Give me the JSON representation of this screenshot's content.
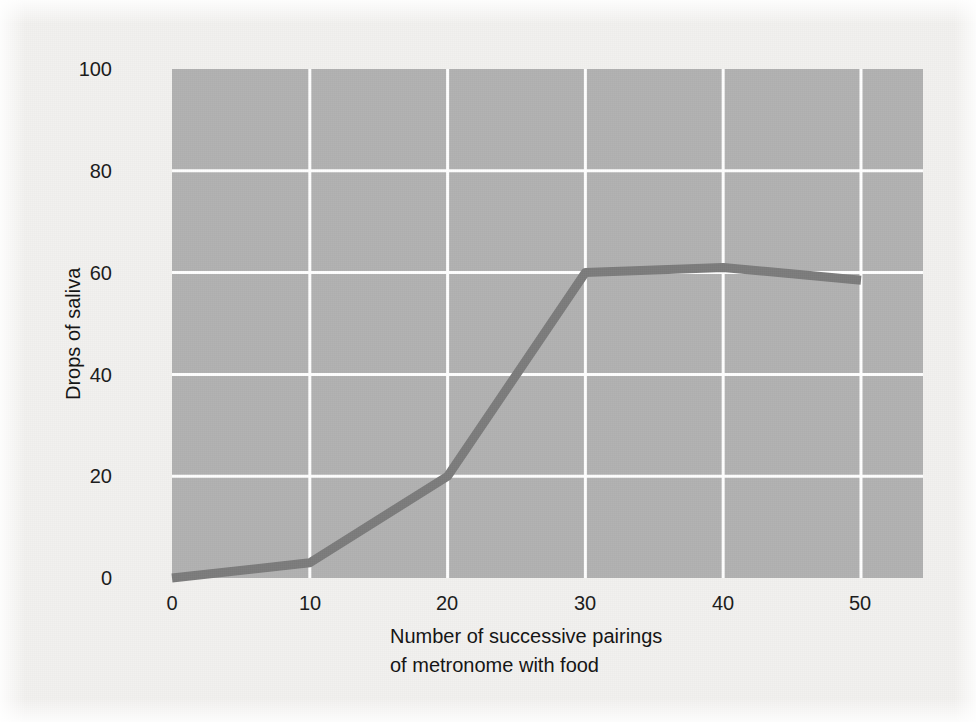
{
  "chart_data": {
    "type": "line",
    "title": "",
    "subtitle": "",
    "xlabel_line1": "Number of successive pairings",
    "xlabel_line2": "of metronome with food",
    "ylabel": "Drops of saliva",
    "x": [
      0,
      10,
      20,
      30,
      40,
      50
    ],
    "values": [
      0,
      3,
      20,
      60,
      61,
      58.5
    ],
    "series": [
      {
        "name": "Drops of saliva",
        "x": [
          0,
          10,
          20,
          30,
          40,
          50
        ],
        "values": [
          0,
          3,
          20,
          60,
          61,
          58.5
        ]
      }
    ],
    "xlim": [
      0,
      54.5
    ],
    "ylim": [
      0,
      100
    ],
    "xticks": [
      0,
      10,
      20,
      30,
      40,
      50
    ],
    "yticks": [
      0,
      20,
      40,
      60,
      80,
      100
    ],
    "xtick_labels": [
      "0",
      "10",
      "20",
      "30",
      "40",
      "50"
    ],
    "ytick_labels": [
      "0",
      "20",
      "40",
      "60",
      "80",
      "100"
    ],
    "grid": true,
    "grid_color": "#ffffff",
    "legend": false,
    "legend_position": "none",
    "plot_background": "#b2b2b2",
    "figure_background": "#f2f1ef",
    "line_color": "#7c7c7c",
    "line_width": 9,
    "tick_label_color": "#1b1b1b",
    "axis_label_color": "#141414"
  }
}
